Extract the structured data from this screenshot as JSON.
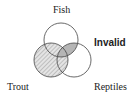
{
  "diagram": {
    "type": "venn",
    "sets": [
      {
        "name": "Fish",
        "label": "Fish"
      },
      {
        "name": "Trout",
        "label": "Trout",
        "shading": "hatched"
      },
      {
        "name": "Reptiles",
        "label": "Reptiles"
      }
    ],
    "shaded_regions": [
      "Fish ∩ Reptiles"
    ],
    "verdict": "Invalid",
    "colors": {
      "outline": "#444444",
      "shade": "#b5b5b5",
      "hatch": "#9a9a9a"
    }
  }
}
